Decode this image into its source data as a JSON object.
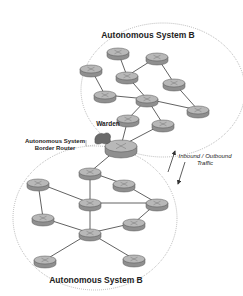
{
  "diagram": {
    "type": "network-topology",
    "colors": {
      "background": "#ffffff",
      "router_top": "#b8b8b8",
      "router_side": "#8f8f8f",
      "router_outline": "#555555",
      "link": "#3a3a3a",
      "boundary": "#888888",
      "warden": "#6a6a6a",
      "text": "#222222"
    },
    "labels": {
      "upper_as": "Autonomous System B",
      "lower_as": "Autonomous System B",
      "warden": "Warden",
      "border_router_line1": "Autonomous System",
      "border_router_line2": "Border Router",
      "traffic_line1": "Inbound / Outbound",
      "traffic_line2": "Traffic"
    },
    "regions": [
      {
        "id": "upper_as",
        "label": "Autonomous System B",
        "cx": 163,
        "cy": 90,
        "rx": 82,
        "ry": 67
      },
      {
        "id": "lower_as",
        "label": "Autonomous System B",
        "cx": 95,
        "cy": 218,
        "rx": 82,
        "ry": 72
      }
    ],
    "nodes": [
      {
        "id": "U1",
        "region": "upper_as",
        "x": 118,
        "y": 52,
        "kind": "router"
      },
      {
        "id": "U2",
        "region": "upper_as",
        "x": 157,
        "y": 57,
        "kind": "router"
      },
      {
        "id": "U3",
        "region": "upper_as",
        "x": 91,
        "y": 69,
        "kind": "router"
      },
      {
        "id": "U4",
        "region": "upper_as",
        "x": 127,
        "y": 76,
        "kind": "router"
      },
      {
        "id": "U5",
        "region": "upper_as",
        "x": 174,
        "y": 83,
        "kind": "router"
      },
      {
        "id": "U6",
        "region": "upper_as",
        "x": 105,
        "y": 95,
        "kind": "router"
      },
      {
        "id": "U7",
        "region": "upper_as",
        "x": 147,
        "y": 99,
        "kind": "router"
      },
      {
        "id": "U8",
        "region": "upper_as",
        "x": 198,
        "y": 110,
        "kind": "router"
      },
      {
        "id": "U9",
        "region": "upper_as",
        "x": 128,
        "y": 119,
        "kind": "router"
      },
      {
        "id": "U10",
        "region": "upper_as",
        "x": 163,
        "y": 124,
        "kind": "router"
      },
      {
        "id": "BR",
        "region": "border",
        "x": 121,
        "y": 146,
        "kind": "border-router"
      },
      {
        "id": "W",
        "region": "border",
        "x": 103,
        "y": 138,
        "kind": "warden"
      },
      {
        "id": "L1",
        "region": "lower_as",
        "x": 90,
        "y": 172,
        "kind": "router"
      },
      {
        "id": "L2",
        "region": "lower_as",
        "x": 38,
        "y": 183,
        "kind": "router"
      },
      {
        "id": "L3",
        "region": "lower_as",
        "x": 124,
        "y": 184,
        "kind": "router"
      },
      {
        "id": "L4",
        "region": "lower_as",
        "x": 90,
        "y": 203,
        "kind": "router"
      },
      {
        "id": "L5",
        "region": "lower_as",
        "x": 157,
        "y": 203,
        "kind": "router"
      },
      {
        "id": "L6",
        "region": "lower_as",
        "x": 43,
        "y": 218,
        "kind": "router"
      },
      {
        "id": "L7",
        "region": "lower_as",
        "x": 134,
        "y": 223,
        "kind": "router"
      },
      {
        "id": "L8",
        "region": "lower_as",
        "x": 90,
        "y": 233,
        "kind": "router"
      },
      {
        "id": "L9",
        "region": "lower_as",
        "x": 45,
        "y": 260,
        "kind": "router"
      },
      {
        "id": "L10",
        "region": "lower_as",
        "x": 134,
        "y": 259,
        "kind": "router"
      }
    ],
    "edges": [
      [
        "U1",
        "U4"
      ],
      [
        "U2",
        "U4"
      ],
      [
        "U2",
        "U5"
      ],
      [
        "U3",
        "U6"
      ],
      [
        "U4",
        "U7"
      ],
      [
        "U5",
        "U8"
      ],
      [
        "U6",
        "U7"
      ],
      [
        "U7",
        "U8"
      ],
      [
        "U7",
        "U9"
      ],
      [
        "U7",
        "U10"
      ],
      [
        "U9",
        "BR"
      ],
      [
        "U10",
        "BR"
      ],
      [
        "BR",
        "L1"
      ],
      [
        "L1",
        "L4"
      ],
      [
        "L1",
        "L3"
      ],
      [
        "L2",
        "L4"
      ],
      [
        "L2",
        "L6"
      ],
      [
        "L3",
        "L5"
      ],
      [
        "L4",
        "L5"
      ],
      [
        "L4",
        "L8"
      ],
      [
        "L6",
        "L8"
      ],
      [
        "L7",
        "L5"
      ],
      [
        "L8",
        "L7"
      ],
      [
        "L8",
        "L10"
      ],
      [
        "L9",
        "L8"
      ]
    ],
    "arrows": [
      {
        "id": "inbound",
        "x1": 168,
        "y1": 172,
        "x2": 175,
        "y2": 151
      },
      {
        "id": "outbound",
        "x1": 185,
        "y1": 162,
        "x2": 178,
        "y2": 184
      }
    ]
  }
}
